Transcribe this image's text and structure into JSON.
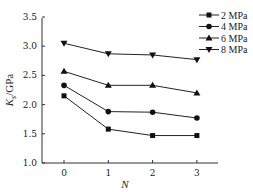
{
  "chart_data": {
    "type": "line",
    "title": "",
    "xlabel": "N",
    "ylabel": "K_s/GPa",
    "x": [
      0,
      1,
      2,
      3
    ],
    "xticks": [
      "0",
      "1",
      "2",
      "3"
    ],
    "yticks": [
      "1.0",
      "1.5",
      "2.0",
      "2.5",
      "3.0",
      "3.5"
    ],
    "ylim": [
      1.0,
      3.5
    ],
    "grid": false,
    "legend_position": "upper right",
    "series": [
      {
        "name": "2 MPa",
        "marker": "square",
        "values": [
          2.15,
          1.58,
          1.47,
          1.47
        ]
      },
      {
        "name": "4 MPa",
        "marker": "circle",
        "values": [
          2.33,
          1.88,
          1.87,
          1.77
        ]
      },
      {
        "name": "6 MPa",
        "marker": "triangle-up",
        "values": [
          2.57,
          2.33,
          2.33,
          2.2
        ]
      },
      {
        "name": "8 MPa",
        "marker": "triangle-down",
        "values": [
          3.05,
          2.87,
          2.85,
          2.77
        ]
      }
    ]
  }
}
